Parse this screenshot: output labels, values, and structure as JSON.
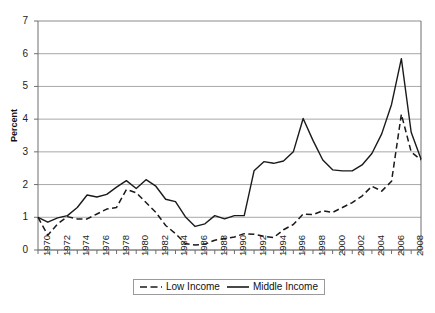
{
  "chart_data": {
    "type": "line",
    "title": "",
    "xlabel": "",
    "ylabel": "Percent",
    "ylim": [
      0,
      7
    ],
    "xlim": [
      1970,
      2009
    ],
    "grid": true,
    "grid_axis": "y",
    "legend_position": "bottom-center",
    "y_ticks": [
      "0",
      "1",
      "2",
      "3",
      "4",
      "5",
      "6",
      "7"
    ],
    "x_ticks": [
      "1970",
      "1972",
      "1974",
      "1976",
      "1978",
      "1980",
      "1982",
      "1984",
      "1986",
      "1988",
      "1990",
      "1992",
      "1994",
      "1996",
      "1998",
      "2000",
      "2002",
      "2004",
      "2006",
      "2008"
    ],
    "x": [
      1970,
      1971,
      1972,
      1973,
      1974,
      1975,
      1976,
      1977,
      1978,
      1979,
      1980,
      1981,
      1982,
      1983,
      1984,
      1985,
      1986,
      1987,
      1988,
      1989,
      1990,
      1991,
      1992,
      1993,
      1994,
      1995,
      1996,
      1997,
      1998,
      1999,
      2000,
      2001,
      2002,
      2003,
      2004,
      2005,
      2006,
      2007,
      2008,
      2009
    ],
    "series": [
      {
        "name": "Low Income",
        "style": "dashed",
        "color": "#1a1a1a",
        "values": [
          1.0,
          0.45,
          0.8,
          1.02,
          0.95,
          0.95,
          1.1,
          1.25,
          1.3,
          1.85,
          1.75,
          1.45,
          1.15,
          0.75,
          0.5,
          0.2,
          0.15,
          0.18,
          0.3,
          0.35,
          0.4,
          0.5,
          0.48,
          0.42,
          0.38,
          0.62,
          0.78,
          1.1,
          1.08,
          1.2,
          1.15,
          1.3,
          1.45,
          1.65,
          1.95,
          1.8,
          2.1,
          4.15,
          3.0,
          2.75
        ]
      },
      {
        "name": "Middle Income",
        "style": "solid",
        "color": "#1a1a1a",
        "values": [
          1.0,
          0.85,
          0.98,
          1.05,
          1.3,
          1.68,
          1.62,
          1.7,
          1.92,
          2.12,
          1.88,
          2.15,
          1.95,
          1.55,
          1.48,
          1.02,
          0.72,
          0.8,
          1.05,
          0.95,
          1.05,
          1.05,
          2.42,
          2.7,
          2.65,
          2.72,
          3.0,
          4.02,
          3.35,
          2.75,
          2.45,
          2.42,
          2.42,
          2.6,
          2.95,
          3.55,
          4.45,
          5.85,
          3.6,
          2.78
        ]
      }
    ]
  },
  "legend": {
    "items": [
      {
        "label": "Low Income",
        "style": "dashed"
      },
      {
        "label": "Middle Income",
        "style": "solid"
      }
    ]
  },
  "caption": ""
}
